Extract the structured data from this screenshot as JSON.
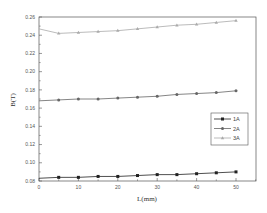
{
  "chart_data": {
    "type": "line",
    "title": "",
    "xlabel": "L(mm)",
    "ylabel": "B(T)",
    "xlim": [
      0,
      55
    ],
    "ylim": [
      0.08,
      0.26
    ],
    "x_ticks": [
      0,
      10,
      20,
      30,
      40,
      50
    ],
    "x_tick_labels": [
      "0",
      "10",
      "20",
      "30",
      "40",
      "50"
    ],
    "y_ticks": [
      0.08,
      0.1,
      0.12,
      0.14,
      0.16,
      0.18,
      0.2,
      0.22,
      0.24,
      0.26
    ],
    "y_tick_labels": [
      "0.08",
      "0.10",
      "0.12",
      "0.14",
      "0.16",
      "0.18",
      "0.20",
      "0.22",
      "0.24",
      "0.26"
    ],
    "grid": false,
    "legend_position": "center-right",
    "x": [
      0,
      5,
      10,
      15,
      20,
      25,
      30,
      35,
      40,
      45,
      50
    ],
    "series": [
      {
        "name": "1A",
        "marker": "square",
        "color": "#222222",
        "values": [
          0.083,
          0.084,
          0.084,
          0.085,
          0.085,
          0.086,
          0.087,
          0.087,
          0.088,
          0.089,
          0.09
        ]
      },
      {
        "name": "2A",
        "marker": "circle",
        "color": "#666666",
        "values": [
          0.168,
          0.169,
          0.17,
          0.17,
          0.171,
          0.172,
          0.173,
          0.175,
          0.176,
          0.177,
          0.179
        ]
      },
      {
        "name": "3A",
        "marker": "triangle",
        "color": "#aaaaaa",
        "values": [
          0.247,
          0.242,
          0.243,
          0.244,
          0.245,
          0.247,
          0.249,
          0.251,
          0.252,
          0.254,
          0.256
        ]
      }
    ]
  }
}
